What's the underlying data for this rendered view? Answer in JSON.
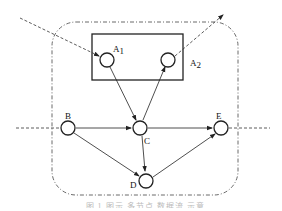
{
  "diagram": {
    "boundary": {
      "style": "dash-dot",
      "shape": "rounded-rectangle"
    },
    "group_box": {
      "contains": [
        "A1",
        "A2"
      ]
    },
    "nodes": [
      {
        "id": "A1",
        "label": "A",
        "sub": "1"
      },
      {
        "id": "A2",
        "label": "A",
        "sub": "2"
      },
      {
        "id": "B",
        "label": "B",
        "sub": ""
      },
      {
        "id": "C",
        "label": "C",
        "sub": ""
      },
      {
        "id": "D",
        "label": "D",
        "sub": ""
      },
      {
        "id": "E",
        "label": "E",
        "sub": ""
      }
    ],
    "edges": [
      {
        "from": "external-top-left",
        "to": "A1",
        "style": "dashed"
      },
      {
        "from": "A2",
        "to": "external-top-right",
        "style": "dashed"
      },
      {
        "from": "A1",
        "to": "C",
        "style": "solid"
      },
      {
        "from": "C",
        "to": "A2",
        "style": "solid"
      },
      {
        "from": "external-left",
        "to": "B",
        "style": "dashed"
      },
      {
        "from": "B",
        "to": "C",
        "style": "solid"
      },
      {
        "from": "B",
        "to": "D",
        "style": "solid"
      },
      {
        "from": "C",
        "to": "D",
        "style": "solid"
      },
      {
        "from": "C",
        "to": "E",
        "style": "solid"
      },
      {
        "from": "D",
        "to": "E",
        "style": "solid"
      },
      {
        "from": "E",
        "to": "external-right",
        "style": "dashed"
      }
    ]
  },
  "caption": {
    "text": "图 1  图示 多节点 数据流 示意"
  }
}
